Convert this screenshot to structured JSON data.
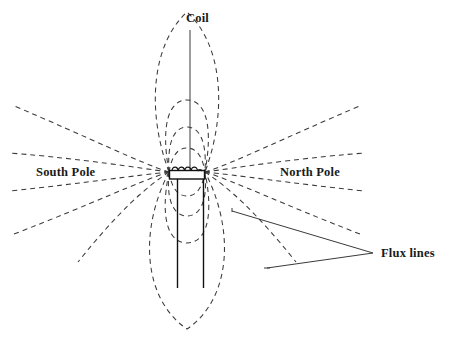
{
  "figure": {
    "background_color": "#ffffff",
    "stroke_color": "#3a3a3a",
    "label_color": "#1a1a1a",
    "width": 452,
    "height": 344
  },
  "labels": {
    "coil": "Coil",
    "south_pole": "South Pole",
    "north_pole": "North Pole",
    "flux_lines": "Flux lines"
  },
  "diagram_data": {
    "type": "schematic-diagram",
    "subject": "electromagnet coil with magnetic flux field lines",
    "components": [
      {
        "name": "coil-winding",
        "shape": "rectangle-with-5-loops",
        "x": 169,
        "y": 167,
        "width": 36,
        "height": 11,
        "loops": 5
      },
      {
        "name": "core-rod-left",
        "shape": "vertical-line",
        "x": 177,
        "y1": 175,
        "y2": 288
      },
      {
        "name": "core-rod-right",
        "shape": "vertical-line",
        "x": 203,
        "y1": 175,
        "y2": 288
      },
      {
        "name": "coil-leader-line",
        "shape": "vertical-line",
        "x": 190,
        "y1": 30,
        "y2": 172
      },
      {
        "name": "flux-leader-upper",
        "shape": "polyline",
        "points": "232,211 373,253"
      },
      {
        "name": "flux-leader-lower",
        "shape": "polyline",
        "points": "267,268 373,253"
      },
      {
        "name": "flux-leader-stub-upper",
        "shape": "short-tick",
        "points": "232,208 232,213"
      },
      {
        "name": "flux-leader-stub-lower",
        "shape": "short-tick",
        "points": "264,268 271,268"
      }
    ],
    "flux_field": {
      "style": "dashed",
      "dash_pattern": "5 4",
      "pole_center_left": {
        "x": 169,
        "y": 172
      },
      "pole_center_right": {
        "x": 205,
        "y": 172
      },
      "upper_loops": 4,
      "lower_loops": 4,
      "radiating_rays_per_side": 5,
      "description": "Concentric dashed arcs above and below the coil gap plus straight dashed rays fanning out horizontally from each pole"
    }
  }
}
